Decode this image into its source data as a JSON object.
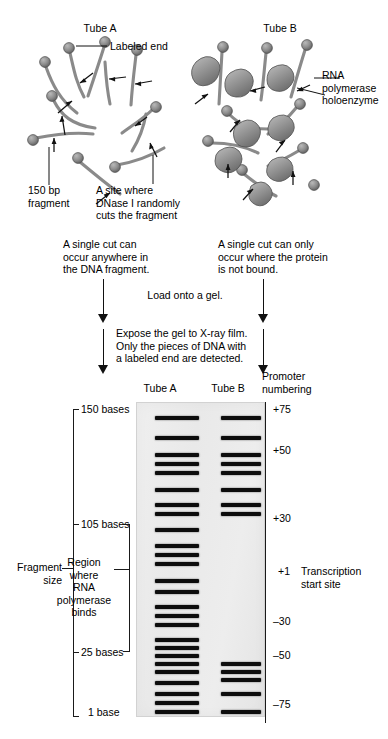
{
  "figure": {
    "type": "dnase-i-footprinting-diagram"
  },
  "top_panel": {
    "tube_a": {
      "title": "Tube A",
      "callouts": {
        "labeled_end": "Labeled end",
        "fragment": "150 bp\nfragment",
        "dnase_site": "A site where\nDNase I randomly\ncuts the fragment"
      }
    },
    "tube_b": {
      "title": "Tube B",
      "callouts": {
        "polymerase": "RNA\npolymerase\nholoenzyme"
      }
    }
  },
  "flow": {
    "note_left": "A single cut can\noccur anywhere in\nthe DNA fragment.",
    "note_right": "A single cut can only\noccur where the protein\nis not bound.",
    "step_1": "Load onto a gel.",
    "step_2": "Expose the gel to X-ray film.\nOnly the pieces of DNA with\na labeled end are detected."
  },
  "gel": {
    "lane_headers": {
      "tube_a": "Tube A",
      "tube_b": "Tube B",
      "promoter": "Promoter\nnumbering"
    },
    "left_axis": {
      "title": "Fragment\nsize",
      "ticks": [
        {
          "label": "150 bases"
        },
        {
          "label": "105 bases"
        },
        {
          "label": "25 bases"
        },
        {
          "label": "1 base"
        }
      ]
    },
    "footprint_bracket": {
      "label": "Region\nwhere\nRNA\npolymerase\nbinds"
    },
    "right_axis": {
      "ticks": [
        {
          "label": "+75"
        },
        {
          "label": "+50"
        },
        {
          "label": "+30"
        },
        {
          "label": "+1"
        },
        {
          "label": "–30"
        },
        {
          "label": "–50"
        },
        {
          "label": "–75"
        }
      ],
      "start_site_label": "Transcription\nstart site"
    }
  },
  "chart_data": {
    "type": "table",
    "xlabel": "Lane",
    "ylabel": "Fragment size (bases)",
    "lanes": [
      "Tube A",
      "Tube B"
    ],
    "gel_box_px": {
      "left": 136,
      "top": 402,
      "width": 129,
      "height": 315
    },
    "left_axis_ticks": [
      {
        "label": "150 bases",
        "y_px": 409
      },
      {
        "label": "105 bases",
        "y_px": 524
      },
      {
        "label": "25 bases",
        "y_px": 652
      },
      {
        "label": "1 base",
        "y_px": 712
      }
    ],
    "right_axis_ticks": [
      {
        "label": "+75",
        "y_px": 410
      },
      {
        "label": "+50",
        "y_px": 451
      },
      {
        "label": "+30",
        "y_px": 519
      },
      {
        "label": "+1",
        "y_px": 572
      },
      {
        "label": "–30",
        "y_px": 622
      },
      {
        "label": "–50",
        "y_px": 656
      },
      {
        "label": "–75",
        "y_px": 705
      }
    ],
    "series": [
      {
        "name": "Tube A",
        "lane": "a",
        "description": "Continuous ladder from 150 bases down to 1 base — DNase I cuts everywhere",
        "band_y_px": [
          415,
          435,
          452,
          461,
          470,
          487,
          502,
          511,
          527,
          543,
          552,
          561,
          578,
          589,
          604,
          613,
          622,
          637,
          645,
          653,
          661,
          669,
          680,
          691,
          700,
          709
        ]
      },
      {
        "name": "Tube B",
        "lane": "b",
        "description": "Same ladder but with a gap (footprint) between ~105 and ~25 bases where RNA polymerase protects the DNA",
        "band_y_px": [
          415,
          435,
          452,
          461,
          470,
          487,
          502,
          511,
          661,
          669,
          677,
          691,
          709
        ]
      }
    ]
  }
}
